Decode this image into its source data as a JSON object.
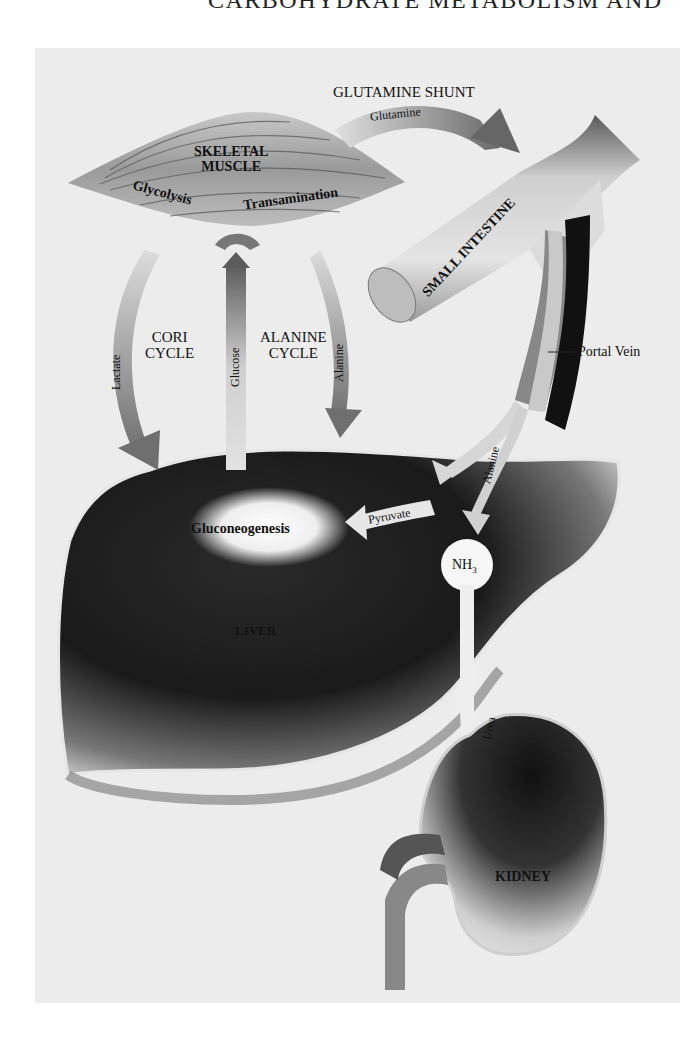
{
  "header": {
    "text": "CARBOHYDRATE METABOLISM AND"
  },
  "diagram": {
    "organs": {
      "skeletal_muscle": "SKELETAL MUSCLE",
      "skeletal_muscle_line1": "SKELETAL",
      "skeletal_muscle_line2": "MUSCLE",
      "small_intestine": "SMALL INTESTINE",
      "liver": "LIVER",
      "kidney": "KIDNEY",
      "portal_vein": "Portal Vein"
    },
    "processes": {
      "glycolysis": "Glycolysis",
      "transamination": "Transamination",
      "gluconeogenesis": "Gluconeogenesis"
    },
    "cycles": {
      "glutamine_shunt": "GLUTAMINE SHUNT",
      "cori_line1": "CORI",
      "cori_line2": "CYCLE",
      "alanine_line1": "ALANINE",
      "alanine_line2": "CYCLE"
    },
    "metabolites": {
      "glutamine": "Glutamine",
      "lactate": "Lactate",
      "glucose": "Glucose",
      "alanine_muscle": "Alanine",
      "alanine_gut": "Alanine",
      "pyruvate": "Pyruvate",
      "nh3": "NH",
      "nh3_sub": "3",
      "urea": "Urea"
    },
    "colors": {
      "background": "#ececec",
      "organ_dark": "#1a1a1a",
      "arrow_gray": "#8a8a8a",
      "highlight": "#ffffff"
    }
  }
}
